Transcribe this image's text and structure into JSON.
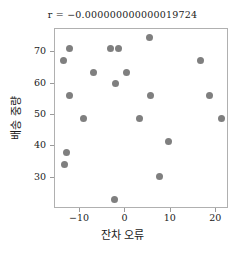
{
  "chart_data": {
    "type": "scatter",
    "title": "r = −0.000000000000019724",
    "xlabel": "잔차 오류",
    "ylabel": "배송 중량",
    "xlim": [
      -15.5,
      22.8
    ],
    "ylim": [
      20.0,
      77.5
    ],
    "xticks": [
      -10,
      0,
      10,
      20
    ],
    "xtick_labels": [
      "−10",
      "0",
      "10",
      "20"
    ],
    "yticks": [
      30,
      40,
      50,
      60,
      70
    ],
    "ytick_labels": [
      "30",
      "40",
      "50",
      "60",
      "70"
    ],
    "grid": false,
    "legend": null,
    "marker_color": "#7f7f7f",
    "marker_size": 7,
    "frame_color": "#b0b0b0",
    "points": [
      {
        "x": -13.6,
        "y": 67.5
      },
      {
        "x": -13.4,
        "y": 34.2
      },
      {
        "x": -13.0,
        "y": 38.2
      },
      {
        "x": -12.2,
        "y": 71.2
      },
      {
        "x": -12.3,
        "y": 56.2
      },
      {
        "x": -9.3,
        "y": 49.0
      },
      {
        "x": -7.0,
        "y": 63.6
      },
      {
        "x": -3.2,
        "y": 71.2
      },
      {
        "x": -2.2,
        "y": 60.0
      },
      {
        "x": -2.3,
        "y": 23.0
      },
      {
        "x": -1.5,
        "y": 71.2
      },
      {
        "x": 0.3,
        "y": 63.6
      },
      {
        "x": 3.2,
        "y": 49.0
      },
      {
        "x": 5.4,
        "y": 74.7
      },
      {
        "x": 5.5,
        "y": 56.2
      },
      {
        "x": 7.6,
        "y": 30.5
      },
      {
        "x": 9.5,
        "y": 41.5
      },
      {
        "x": 16.6,
        "y": 67.3
      },
      {
        "x": 18.5,
        "y": 56.2
      },
      {
        "x": 21.2,
        "y": 49.0
      }
    ]
  }
}
